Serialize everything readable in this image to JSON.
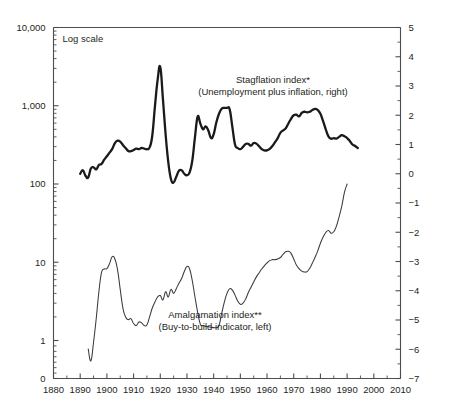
{
  "chart_data": {
    "type": "line",
    "title": "",
    "subtitle": "",
    "note": "Log scale",
    "xlabel": "",
    "ylabel": "",
    "grid": false,
    "legend_position": "inline-annotation",
    "x_axis": {
      "label": "",
      "min": 1880,
      "max": 2010,
      "ticks": [
        1880,
        1890,
        1900,
        1910,
        1920,
        1930,
        1940,
        1950,
        1960,
        1970,
        1980,
        1990,
        2000,
        2010
      ],
      "tick_labels": [
        "1880",
        "1890",
        "1900",
        "1910",
        "1920",
        "1930",
        "1940",
        "1950",
        "1960",
        "1970",
        "1980",
        "1990",
        "2000",
        "2010"
      ],
      "minor_tick_interval": 5
    },
    "y_left_axis": {
      "label": "",
      "scale": "log",
      "min": 1,
      "max": 10000,
      "ticks": [
        1,
        10,
        100,
        1000,
        10000
      ],
      "tick_labels": [
        "1",
        "10",
        "100",
        "1,000",
        "10,000"
      ],
      "baseline_label": "0",
      "minor_ticks": "decade subdivisions 2-9"
    },
    "y_right_axis": {
      "label": "",
      "scale": "linear",
      "min": -7,
      "max": 5,
      "ticks": [
        5,
        4,
        3,
        2,
        1,
        0,
        -1,
        -2,
        -3,
        -4,
        -5,
        -6,
        -7
      ],
      "tick_labels": [
        "5",
        "4",
        "3",
        "2",
        "1",
        "0",
        "−1",
        "−2",
        "−3",
        "−4",
        "−5",
        "−6",
        "−7"
      ],
      "minor_tick_interval": 0.5
    },
    "series": [
      {
        "name": "Stagflation index*",
        "annotation_line1": "Stagflation index*",
        "annotation_line2": "(Unemployment plus inflation, right)",
        "axis": "right",
        "style": "thick",
        "color": "#1a1a1a",
        "annotation_x": 273,
        "annotation_y": 83,
        "points": [
          [
            1890,
            0.0
          ],
          [
            1891,
            0.12
          ],
          [
            1892,
            -0.07
          ],
          [
            1893,
            -0.13
          ],
          [
            1894,
            0.18
          ],
          [
            1895,
            0.22
          ],
          [
            1896,
            0.15
          ],
          [
            1897,
            0.3
          ],
          [
            1898,
            0.34
          ],
          [
            1899,
            0.48
          ],
          [
            1900,
            0.6
          ],
          [
            1901,
            0.72
          ],
          [
            1902,
            0.85
          ],
          [
            1903,
            1.05
          ],
          [
            1904,
            1.13
          ],
          [
            1905,
            1.1
          ],
          [
            1906,
            0.98
          ],
          [
            1907,
            0.88
          ],
          [
            1908,
            0.78
          ],
          [
            1909,
            0.77
          ],
          [
            1910,
            0.81
          ],
          [
            1911,
            0.86
          ],
          [
            1912,
            0.84
          ],
          [
            1913,
            0.88
          ],
          [
            1914,
            0.86
          ],
          [
            1915,
            0.84
          ],
          [
            1916,
            0.9
          ],
          [
            1917,
            1.3
          ],
          [
            1918,
            2.3
          ],
          [
            1919,
            3.2
          ],
          [
            1920,
            3.65
          ],
          [
            1921,
            2.55
          ],
          [
            1922,
            1.35
          ],
          [
            1923,
            0.4
          ],
          [
            1924,
            -0.18
          ],
          [
            1925,
            -0.3
          ],
          [
            1926,
            -0.1
          ],
          [
            1927,
            0.1
          ],
          [
            1928,
            0.12
          ],
          [
            1929,
            0.0
          ],
          [
            1930,
            -0.05
          ],
          [
            1931,
            0.05
          ],
          [
            1932,
            0.45
          ],
          [
            1933,
            1.25
          ],
          [
            1934,
            1.95
          ],
          [
            1935,
            1.72
          ],
          [
            1936,
            1.52
          ],
          [
            1937,
            1.62
          ],
          [
            1938,
            1.48
          ],
          [
            1939,
            1.22
          ],
          [
            1940,
            1.35
          ],
          [
            1941,
            1.75
          ],
          [
            1942,
            2.05
          ],
          [
            1943,
            2.22
          ],
          [
            1944,
            2.25
          ],
          [
            1945,
            2.25
          ],
          [
            1946,
            2.2
          ],
          [
            1947,
            1.6
          ],
          [
            1948,
            1.0
          ],
          [
            1949,
            0.88
          ],
          [
            1950,
            0.84
          ],
          [
            1951,
            0.92
          ],
          [
            1952,
            1.02
          ],
          [
            1953,
            1.02
          ],
          [
            1954,
            0.96
          ],
          [
            1955,
            1.05
          ],
          [
            1956,
            1.03
          ],
          [
            1957,
            0.94
          ],
          [
            1958,
            0.84
          ],
          [
            1959,
            0.8
          ],
          [
            1960,
            0.8
          ],
          [
            1961,
            0.85
          ],
          [
            1962,
            0.95
          ],
          [
            1963,
            1.08
          ],
          [
            1964,
            1.22
          ],
          [
            1965,
            1.4
          ],
          [
            1966,
            1.48
          ],
          [
            1967,
            1.55
          ],
          [
            1968,
            1.72
          ],
          [
            1969,
            1.88
          ],
          [
            1970,
            2.0
          ],
          [
            1971,
            2.02
          ],
          [
            1972,
            1.96
          ],
          [
            1973,
            2.08
          ],
          [
            1974,
            2.12
          ],
          [
            1975,
            2.1
          ],
          [
            1976,
            2.12
          ],
          [
            1977,
            2.18
          ],
          [
            1978,
            2.22
          ],
          [
            1979,
            2.18
          ],
          [
            1980,
            2.05
          ],
          [
            1981,
            1.8
          ],
          [
            1982,
            1.52
          ],
          [
            1983,
            1.28
          ],
          [
            1984,
            1.2
          ],
          [
            1985,
            1.22
          ],
          [
            1986,
            1.2
          ],
          [
            1987,
            1.26
          ],
          [
            1988,
            1.32
          ],
          [
            1989,
            1.28
          ],
          [
            1990,
            1.22
          ],
          [
            1991,
            1.12
          ],
          [
            1992,
            1.0
          ],
          [
            1993,
            0.95
          ],
          [
            1994,
            0.88
          ]
        ]
      },
      {
        "name": "Amalgamation index**",
        "annotation_line1": "Amalgamation index**",
        "annotation_line2": "(Buy-to-build indicator, left)",
        "axis": "left",
        "style": "thin",
        "color": "#3a3a3a",
        "annotation_x": 215,
        "annotation_y": 318,
        "points": [
          [
            1893,
            0.78
          ],
          [
            1894,
            0.55
          ],
          [
            1895,
            0.95
          ],
          [
            1896,
            1.9
          ],
          [
            1897,
            4.2
          ],
          [
            1898,
            7.4
          ],
          [
            1899,
            8.2
          ],
          [
            1900,
            8.3
          ],
          [
            1901,
            9.6
          ],
          [
            1902,
            11.8
          ],
          [
            1903,
            11.0
          ],
          [
            1904,
            8.0
          ],
          [
            1905,
            4.5
          ],
          [
            1906,
            2.6
          ],
          [
            1907,
            2.0
          ],
          [
            1908,
            1.85
          ],
          [
            1909,
            1.9
          ],
          [
            1910,
            1.65
          ],
          [
            1911,
            1.55
          ],
          [
            1912,
            1.72
          ],
          [
            1913,
            1.68
          ],
          [
            1914,
            1.55
          ],
          [
            1915,
            1.58
          ],
          [
            1916,
            2.0
          ],
          [
            1917,
            2.6
          ],
          [
            1918,
            3.1
          ],
          [
            1919,
            3.6
          ],
          [
            1920,
            3.75
          ],
          [
            1921,
            3.3
          ],
          [
            1922,
            4.2
          ],
          [
            1923,
            3.6
          ],
          [
            1924,
            4.5
          ],
          [
            1925,
            4.0
          ],
          [
            1926,
            4.6
          ],
          [
            1927,
            5.4
          ],
          [
            1928,
            6.2
          ],
          [
            1929,
            7.6
          ],
          [
            1930,
            8.8
          ],
          [
            1931,
            8.2
          ],
          [
            1932,
            5.8
          ],
          [
            1933,
            3.6
          ],
          [
            1934,
            2.3
          ],
          [
            1935,
            1.62
          ],
          [
            1936,
            1.55
          ],
          [
            1937,
            1.52
          ],
          [
            1938,
            1.5
          ],
          [
            1939,
            1.48
          ],
          [
            1940,
            1.46
          ],
          [
            1941,
            1.46
          ],
          [
            1942,
            1.55
          ],
          [
            1943,
            2.2
          ],
          [
            1944,
            3.1
          ],
          [
            1945,
            4.0
          ],
          [
            1946,
            4.6
          ],
          [
            1947,
            4.4
          ],
          [
            1948,
            3.8
          ],
          [
            1949,
            3.2
          ],
          [
            1950,
            2.9
          ],
          [
            1951,
            3.0
          ],
          [
            1952,
            3.4
          ],
          [
            1953,
            4.1
          ],
          [
            1954,
            4.8
          ],
          [
            1955,
            5.6
          ],
          [
            1956,
            6.5
          ],
          [
            1957,
            7.3
          ],
          [
            1958,
            8.2
          ],
          [
            1959,
            9.0
          ],
          [
            1960,
            9.8
          ],
          [
            1961,
            10.5
          ],
          [
            1962,
            10.8
          ],
          [
            1963,
            10.8
          ],
          [
            1964,
            11.0
          ],
          [
            1965,
            11.5
          ],
          [
            1966,
            12.6
          ],
          [
            1967,
            13.6
          ],
          [
            1968,
            13.8
          ],
          [
            1969,
            13.0
          ],
          [
            1970,
            11.0
          ],
          [
            1971,
            9.2
          ],
          [
            1972,
            8.3
          ],
          [
            1973,
            7.7
          ],
          [
            1974,
            7.5
          ],
          [
            1975,
            7.6
          ],
          [
            1976,
            8.4
          ],
          [
            1977,
            9.8
          ],
          [
            1978,
            11.6
          ],
          [
            1979,
            14.0
          ],
          [
            1980,
            17.5
          ],
          [
            1981,
            21.0
          ],
          [
            1982,
            24.0
          ],
          [
            1983,
            25.5
          ],
          [
            1984,
            23.5
          ],
          [
            1985,
            24.5
          ],
          [
            1986,
            29.0
          ],
          [
            1987,
            38.0
          ],
          [
            1988,
            52.0
          ],
          [
            1989,
            78.0
          ],
          [
            1990,
            100.0
          ]
        ]
      }
    ]
  }
}
